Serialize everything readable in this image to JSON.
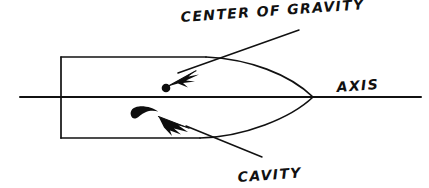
{
  "figure": {
    "title": "",
    "background_color": "#ffffff",
    "ink_color": "#111111",
    "style": "hand-drawn technical sketch",
    "labels": {
      "center_of_gravity": "CENTER OF GRAVITY",
      "cavity": "CAVITY",
      "axis": "AXIS"
    },
    "annotations": [
      {
        "name": "center-of-gravity",
        "text": "CENTER OF GRAVITY",
        "text_x": 181,
        "text_y": 22,
        "font_size": 14,
        "rotation": -4,
        "marker": "filled-dot",
        "marker_x": 166,
        "marker_y": 88,
        "marker_r": 4.2,
        "leader_from_x": 299,
        "leader_from_y": 30,
        "leader_to_x": 178,
        "leader_to_y": 73,
        "arrow_tip_x": 168,
        "arrow_tip_y": 86
      },
      {
        "name": "cavity",
        "text": "CAVITY",
        "text_x": 238,
        "text_y": 182,
        "font_size": 14,
        "rotation": -4,
        "marker": "filled-crescent",
        "marker_x": 144,
        "marker_y": 112,
        "leader_from_x": 262,
        "leader_from_y": 157,
        "leader_to_x": 186,
        "leader_to_y": 126,
        "arrow_tip_x": 160,
        "arrow_tip_y": 117
      },
      {
        "name": "axis",
        "text": "AXIS",
        "text_x": 337,
        "text_y": 92,
        "font_size": 14,
        "rotation": -4,
        "marker": "none"
      }
    ],
    "geometry": {
      "axis": {
        "x1": 20,
        "y1": 97,
        "x2": 421,
        "y2": 97
      },
      "nose": {
        "x": 61,
        "y_top": 57,
        "y_bottom": 138
      },
      "top_edge": {
        "x1": 61,
        "y1": 57,
        "x2": 206,
        "y2": 57
      },
      "bottom_edge": {
        "x1": 61,
        "y1": 138,
        "x2": 200,
        "y2": 138
      },
      "tail_tip": {
        "x": 313,
        "y": 97
      },
      "upper_tail_curve": "M206,57 C248,59 288,74 313,97",
      "lower_tail_curve": "M200,138 C243,137 290,118 313,97"
    }
  }
}
